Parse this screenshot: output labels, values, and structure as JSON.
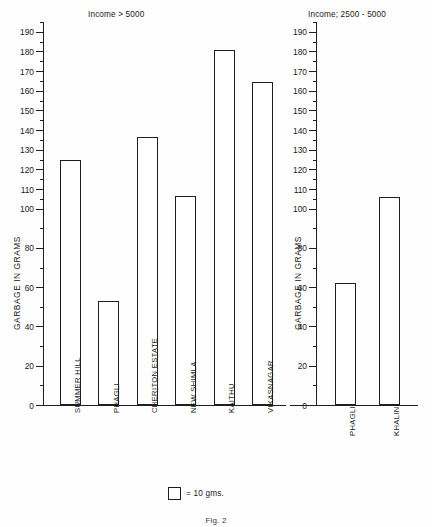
{
  "figure": {
    "caption": "Fig. 2",
    "legend": {
      "label": "= 10 gms.",
      "swatch_name": "open-square"
    },
    "y_axis_label": "GARBAGE IN GRAMS",
    "line_color": "#1f1f1f",
    "bar_fill": "#ffffff",
    "background": "#fefefe"
  },
  "chart_data": [
    {
      "type": "bar",
      "title": "Income > 5000",
      "xlabel": "",
      "ylabel": "GARBAGE IN GRAMS",
      "ylim": [
        0,
        195
      ],
      "grid": false,
      "legend": "= 10 gms.",
      "tick_values": [
        0,
        20,
        40,
        60,
        80,
        100,
        110,
        120,
        130,
        140,
        150,
        160,
        170,
        180,
        190
      ],
      "tick_labels": [
        "0",
        "20",
        "40",
        "60",
        "80",
        "100",
        "110",
        "120",
        "130",
        "140",
        "150",
        "160",
        "170",
        "180",
        "190"
      ],
      "minor_tick_values": [
        10,
        30,
        50,
        70,
        90,
        105,
        115,
        125,
        135,
        145,
        155,
        165,
        175,
        185,
        195
      ],
      "categories": [
        "SUMMER HILL",
        "PHAGLI",
        "CHERITON ESTATE",
        "NEW SHIMLA",
        "KAITHU",
        "VIKASNAGAR"
      ],
      "values": [
        124.5,
        53,
        136.5,
        106.5,
        181,
        164.5
      ]
    },
    {
      "type": "bar",
      "title": "Income; 2500 - 5000",
      "xlabel": "",
      "ylabel": "GARBAGE IN GRAMS",
      "ylim": [
        0,
        195
      ],
      "grid": false,
      "tick_values": [
        0,
        20,
        40,
        60,
        80,
        100,
        110,
        120,
        130,
        140,
        150,
        160,
        170,
        180,
        190
      ],
      "tick_labels": [
        "0",
        "20",
        "40",
        "60",
        "80",
        "100",
        "110",
        "120",
        "130",
        "140",
        "150",
        "160",
        "170",
        "180",
        "190"
      ],
      "minor_tick_values": [
        10,
        30,
        50,
        70,
        90,
        105,
        115,
        125,
        135,
        145,
        155,
        165,
        175,
        185,
        195
      ],
      "categories": [
        "PHAGLI",
        "KHALINI"
      ],
      "values": [
        62,
        106
      ]
    }
  ]
}
